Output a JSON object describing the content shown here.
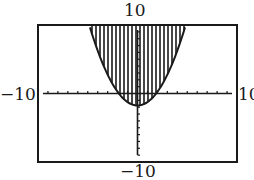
{
  "chart_data": {
    "type": "area",
    "title": "",
    "window": {
      "xmin": -10,
      "xmax": 10,
      "ymin": -10,
      "ymax": 10,
      "xscl": 1,
      "yscl": 1
    },
    "labels": {
      "top": "10",
      "bottom": "-10",
      "left": "-10",
      "right": "10"
    },
    "curve": {
      "equation": "y = 0.5x^2 - 1.75",
      "vertex": [
        0,
        -1.75
      ],
      "shading": "above"
    },
    "top_edge_intersections": [
      -4.7,
      4.6
    ],
    "xlabel": "",
    "ylabel": "",
    "grid": false,
    "colors": {
      "ink": "#1a1a1a",
      "background": "#ffffff"
    }
  },
  "axes_labels": {
    "top": "10",
    "bottom": "−10",
    "left": "−10",
    "right": "10"
  }
}
